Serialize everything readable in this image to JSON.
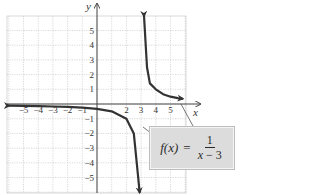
{
  "chart_data": {
    "type": "line",
    "title": "",
    "function_label": "f(x) = 1/(x − 3)",
    "formula": {
      "lhs": "f(x)",
      "equals": "=",
      "numerator": "1",
      "denominator_var": "x",
      "denominator_rest": " − 3"
    },
    "xlabel": "x",
    "ylabel": "y",
    "xlim": [
      -6,
      6
    ],
    "ylim": [
      -6,
      6
    ],
    "grid": true,
    "x_ticks": [
      -5,
      -4,
      -3,
      -2,
      -1,
      2,
      3,
      4,
      5
    ],
    "x_tick_labels": [
      "−5",
      "−4",
      "−3",
      "−2",
      "−1",
      "2",
      "3",
      "4",
      "5"
    ],
    "y_ticks": [
      5,
      4,
      3,
      2,
      1,
      -1,
      -2,
      -3,
      -4,
      -5
    ],
    "y_tick_labels": [
      "5",
      "4",
      "3",
      "2",
      "1",
      "−1",
      "−2",
      "−3",
      "−4",
      "−5"
    ],
    "vertical_asymptote_x": 3.2,
    "vertical_asymptote_x_note": "Estimated from the plotted curve; the caption's formula would place it at x = 3.",
    "series": [
      {
        "name": "left branch",
        "x": [
          -6,
          -5,
          -4,
          -3,
          -2,
          -1,
          0,
          1,
          2,
          2.5,
          2.8,
          2.9
        ],
        "y": [
          -0.11,
          -0.13,
          -0.14,
          -0.17,
          -0.2,
          -0.25,
          -0.33,
          -0.5,
          -1,
          -2,
          -5,
          -6
        ]
      },
      {
        "name": "right branch",
        "x": [
          3.2,
          3.4,
          3.6,
          4,
          4.5,
          5,
          5.5,
          5.8
        ],
        "y": [
          6,
          2.5,
          1.4,
          1,
          0.67,
          0.5,
          0.4,
          0.36
        ]
      }
    ]
  }
}
